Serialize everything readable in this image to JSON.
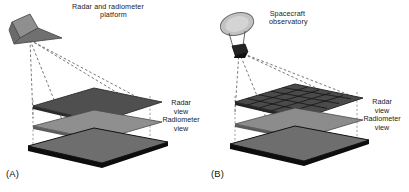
{
  "figure": {
    "background": "#ffffff",
    "ink": "#1a1a1a"
  },
  "panels": [
    {
      "id": "A",
      "label": "(A)",
      "platform": {
        "icon": "aircraft-icon",
        "caption_line1": "Radar and radiometer",
        "caption_line2": "platform",
        "fill": "#8a8a8a",
        "stroke": "#4a4a4a"
      },
      "surfaces": [
        {
          "name": "radar-view-plane",
          "caption": "Radar",
          "caption2": "view",
          "fill": "#4f4f4f",
          "gridded": false
        },
        {
          "name": "radiometer-view-plane",
          "caption": "Radiometer",
          "caption2": "view",
          "fill": "#8f8f8f",
          "gridded": false
        },
        {
          "name": "ground-plane",
          "caption": "",
          "caption2": "",
          "fill": "#6e6e6e",
          "gridded": false
        }
      ],
      "beam_style": "dashed"
    },
    {
      "id": "B",
      "label": "(B)",
      "platform": {
        "icon": "satellite-dish-icon",
        "caption_line1": "Spacecraft",
        "caption_line2": "observatory",
        "fill": "#b8b8b8",
        "stroke": "#555555"
      },
      "surfaces": [
        {
          "name": "radar-view-plane",
          "caption": "Radar",
          "caption2": "view",
          "fill": "#4a4a4a",
          "gridded": true,
          "grid_cols": 5,
          "grid_rows": 5
        },
        {
          "name": "radiometer-view-plane",
          "caption": "Radiometer",
          "caption2": "view",
          "fill": "#8c8c8c",
          "gridded": false
        },
        {
          "name": "ground-plane",
          "caption": "",
          "caption2": "",
          "fill": "#6e6e6e",
          "gridded": false
        }
      ],
      "beam_style": "dashed"
    }
  ]
}
